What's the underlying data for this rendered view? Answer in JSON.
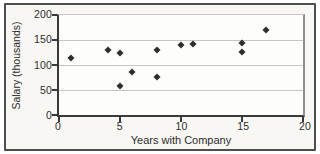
{
  "chart_data": {
    "type": "scatter",
    "title": "",
    "xlabel": "Years with Company",
    "ylabel": "Salary (thousands)",
    "xlim": [
      0,
      20
    ],
    "ylim": [
      0,
      200
    ],
    "xticks": [
      0,
      5,
      10,
      15,
      20
    ],
    "yticks": [
      0,
      50,
      100,
      150,
      200
    ],
    "grid": "horizontal",
    "legend": "none",
    "marker": "diamond",
    "points": [
      {
        "x": 1,
        "y": 114
      },
      {
        "x": 4,
        "y": 131
      },
      {
        "x": 5,
        "y": 124
      },
      {
        "x": 5,
        "y": 58
      },
      {
        "x": 6,
        "y": 86
      },
      {
        "x": 8,
        "y": 130
      },
      {
        "x": 8,
        "y": 77
      },
      {
        "x": 10,
        "y": 140
      },
      {
        "x": 11,
        "y": 143
      },
      {
        "x": 15,
        "y": 144
      },
      {
        "x": 15,
        "y": 127
      },
      {
        "x": 17,
        "y": 170
      }
    ],
    "colors": {
      "frame": "#4e4e4e",
      "panel_bg": "#f8f7f4",
      "plot_bg": "#fdfdfb",
      "axis": "#3a3a3a",
      "grid": "#c6c6c3",
      "frame_right": "#8f8f8f",
      "marker": "#2e2e2e",
      "text": "#2d2d2d"
    }
  }
}
